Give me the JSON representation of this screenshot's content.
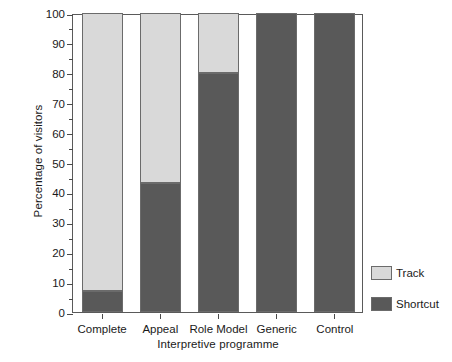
{
  "chart_data": {
    "type": "bar",
    "stacked": true,
    "title": "",
    "xlabel": "Interpretive programme",
    "ylabel": "Percentage of visitors",
    "categories": [
      "Complete",
      "Appeal",
      "Role Model",
      "Generic",
      "Control"
    ],
    "series": [
      {
        "name": "Shortcut",
        "color": "#595959",
        "values": [
          7,
          43,
          80,
          100,
          100
        ]
      },
      {
        "name": "Track",
        "color": "#d9d9d9",
        "values": [
          93,
          57,
          20,
          0,
          0
        ]
      }
    ],
    "ylim": [
      0,
      100
    ],
    "y_ticks": [
      0,
      10,
      20,
      30,
      40,
      50,
      60,
      70,
      80,
      90,
      100
    ],
    "y_tick_labels": [
      "0",
      "10",
      "20",
      "30",
      "40",
      "50",
      "60",
      "70",
      "80",
      "90",
      "100"
    ],
    "y_minor_ticks": [
      5,
      15,
      25,
      35,
      45,
      55,
      65,
      75,
      85,
      95
    ],
    "grid": false,
    "legend_position": "right",
    "legend_entries": [
      {
        "label": "Track",
        "color": "#d9d9d9"
      },
      {
        "label": "Shortcut",
        "color": "#595959"
      }
    ]
  },
  "axes": {
    "frame_color": "#5a5a5a",
    "tick_color": "#4a4a4a"
  }
}
